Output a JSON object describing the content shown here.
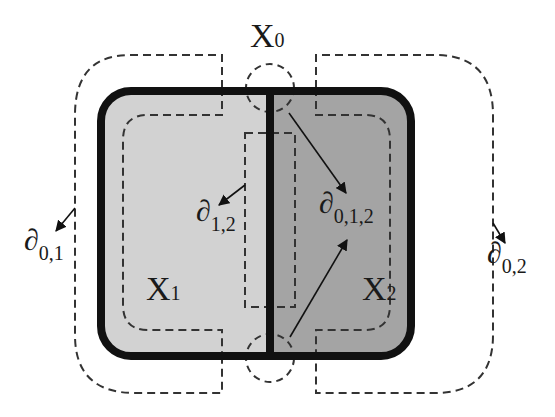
{
  "diagram": {
    "type": "set-partition-boundary",
    "regions": {
      "x0": {
        "label": "X",
        "sub": "0"
      },
      "x1": {
        "label": "X",
        "sub": "1",
        "fill": "#d2d2d2"
      },
      "x2": {
        "label": "X",
        "sub": "2",
        "fill": "#a4a4a4"
      }
    },
    "boundaries": {
      "b01": {
        "symbol": "∂",
        "sub": "0,1"
      },
      "b02": {
        "symbol": "∂",
        "sub": "0,2"
      },
      "b12": {
        "symbol": "∂",
        "sub": "1,2"
      },
      "b012": {
        "symbol": "∂",
        "sub": "0,1,2"
      }
    },
    "colors": {
      "outline": "#111111",
      "dash": "#333333",
      "background": "#ffffff"
    }
  }
}
